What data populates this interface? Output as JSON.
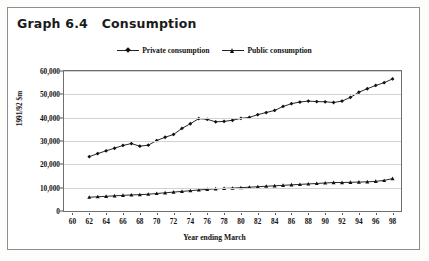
{
  "title": "Graph 6.4   Consumption",
  "legend": {
    "position": "top-center",
    "entries": [
      {
        "label": "Private consumption",
        "marker": "diamond",
        "color": "#111111"
      },
      {
        "label": "Public consumption",
        "marker": "triangle",
        "color": "#111111"
      }
    ]
  },
  "chart_data": {
    "type": "line",
    "title": "Graph 6.4   Consumption",
    "xlabel": "Year ending March",
    "ylabel": "1991/92 $m",
    "grid": true,
    "legend_position": "top-center",
    "xlim": [
      59,
      99
    ],
    "ylim": [
      0,
      60000
    ],
    "ytick_labels": [
      "60,000",
      "50,000",
      "40,000",
      "30,000",
      "20,000",
      "10,000",
      "0"
    ],
    "ytick_values": [
      60000,
      50000,
      40000,
      30000,
      20000,
      10000,
      0
    ],
    "xtick_labels": [
      "60",
      "62",
      "64",
      "66",
      "68",
      "70",
      "72",
      "74",
      "76",
      "78",
      "80",
      "82",
      "84",
      "86",
      "88",
      "90",
      "92",
      "94",
      "96",
      "98"
    ],
    "xtick_values": [
      60,
      62,
      64,
      66,
      68,
      70,
      72,
      74,
      76,
      78,
      80,
      82,
      84,
      86,
      88,
      90,
      92,
      94,
      96,
      98
    ],
    "x": [
      62,
      63,
      64,
      65,
      66,
      67,
      68,
      69,
      70,
      71,
      72,
      73,
      74,
      75,
      76,
      77,
      78,
      79,
      80,
      81,
      82,
      83,
      84,
      85,
      86,
      87,
      88,
      89,
      90,
      91,
      92,
      93,
      94,
      95,
      96,
      97,
      98
    ],
    "series": [
      {
        "name": "Private consumption",
        "marker": "diamond",
        "color": "#111111",
        "values": [
          23300,
          24600,
          25800,
          26900,
          28100,
          28900,
          27800,
          28200,
          30200,
          31600,
          32800,
          35400,
          37400,
          39600,
          39300,
          38200,
          38400,
          38900,
          39700,
          40100,
          41300,
          42200,
          43100,
          44800,
          46000,
          46700,
          47100,
          46900,
          46800,
          46500,
          47100,
          48700,
          50900,
          52400,
          53800,
          55000,
          56600
        ]
      },
      {
        "name": "Public consumption",
        "marker": "triangle",
        "color": "#111111",
        "values": [
          5900,
          6100,
          6300,
          6500,
          6700,
          6900,
          7000,
          7200,
          7500,
          7800,
          8100,
          8400,
          8700,
          9000,
          9300,
          9500,
          9700,
          9800,
          10000,
          10200,
          10400,
          10600,
          10800,
          11000,
          11200,
          11400,
          11600,
          11800,
          12000,
          12200,
          12200,
          12300,
          12400,
          12500,
          12700,
          13100,
          13900
        ]
      }
    ]
  }
}
